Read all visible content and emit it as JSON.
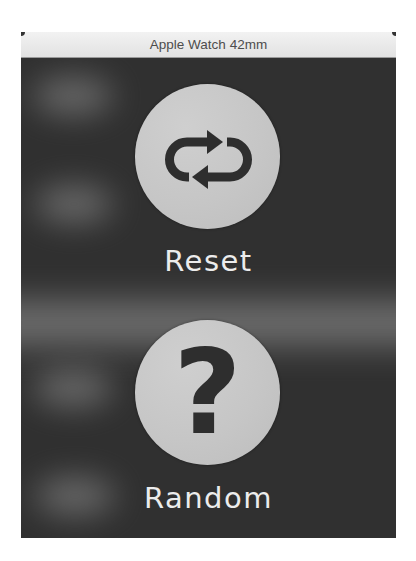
{
  "window": {
    "title": "Apple Watch 42mm"
  },
  "screen": {
    "background_color": "#303030",
    "actions": [
      {
        "label": "Reset",
        "icon": "repeat-arrows-icon"
      },
      {
        "label": "Random",
        "icon": "question-mark-icon",
        "glyph": "?"
      }
    ]
  },
  "colors": {
    "button_circle": "#c6c6c6",
    "icon_color": "#2e2e2e",
    "label_color": "#ececec",
    "titlebar": "#e8e8e8"
  }
}
